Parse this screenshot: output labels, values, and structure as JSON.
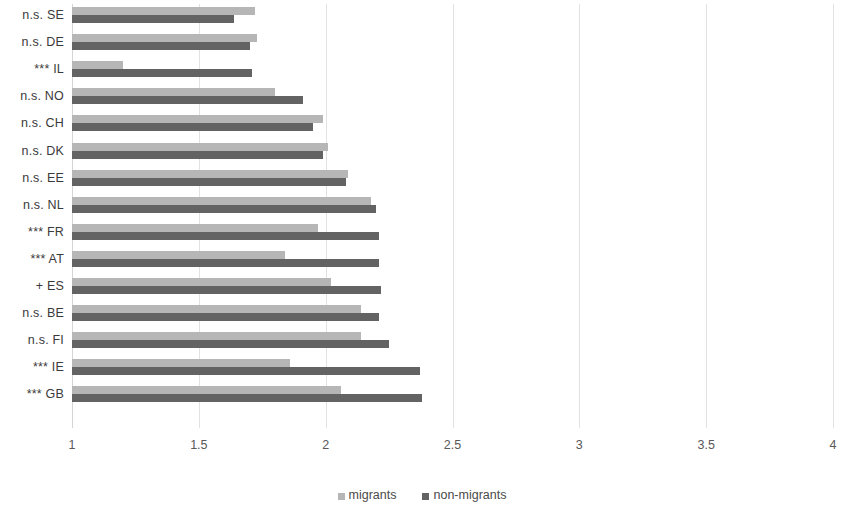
{
  "chart_data": {
    "type": "bar",
    "orientation": "horizontal",
    "title": "",
    "xlabel": "",
    "ylabel": "",
    "xlim": [
      1,
      4
    ],
    "xticks": [
      "1",
      "1.5",
      "2",
      "2.5",
      "3",
      "3.5",
      "4"
    ],
    "xtick_values": [
      1,
      1.5,
      2,
      2.5,
      3,
      3.5,
      4
    ],
    "grid": true,
    "legend_position": "bottom",
    "categories": [
      "n.s. SE",
      "n.s. DE",
      "*** IL",
      "n.s. NO",
      "n.s. CH",
      "n.s. DK",
      "n.s. EE",
      "n.s. NL",
      "*** FR",
      "*** AT",
      "+ ES",
      "n.s. BE",
      "n.s. FI",
      "*** IE",
      "*** GB"
    ],
    "series": [
      {
        "name": "migrants",
        "color": "#b6b6b6",
        "values": [
          1.72,
          1.73,
          1.2,
          1.8,
          1.99,
          2.01,
          2.09,
          2.18,
          1.97,
          1.84,
          2.02,
          2.14,
          2.14,
          1.86,
          2.06
        ]
      },
      {
        "name": "non-migrants",
        "color": "#636363",
        "values": [
          1.64,
          1.7,
          1.71,
          1.91,
          1.95,
          1.99,
          2.08,
          2.2,
          2.21,
          2.21,
          2.22,
          2.21,
          2.25,
          2.37,
          2.38
        ]
      }
    ]
  },
  "legend": {
    "items": [
      {
        "label": "migrants",
        "color": "#b6b6b6"
      },
      {
        "label": "non-migrants",
        "color": "#636363"
      }
    ]
  },
  "colors": {
    "migrants": "#b6b6b6",
    "non_migrants": "#636363",
    "gridline": "#e2e2e2",
    "text": "#3a3a3a",
    "background": "#ffffff"
  }
}
